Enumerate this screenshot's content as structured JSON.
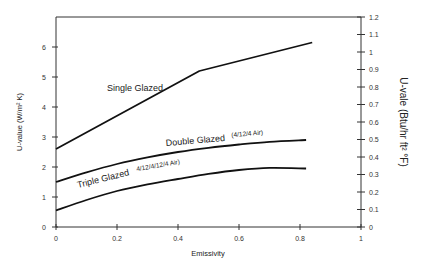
{
  "chart_data": {
    "type": "line",
    "title": "",
    "xlabel": "Emissivity",
    "ylabel": "U-value (W/m² K)",
    "ylabel_right": "U-vale (Btu/hr ft² °F)",
    "xlim": [
      0,
      1
    ],
    "ylim": [
      0,
      7
    ],
    "ylim_right": [
      0,
      1.2
    ],
    "grid": false,
    "x_ticks": [
      "0",
      "0.2",
      "0.4",
      "0.6",
      "0.8",
      "1"
    ],
    "y_ticks": [
      "0",
      "1",
      "2",
      "3",
      "4",
      "5",
      "6"
    ],
    "y_ticks_right": [
      "0",
      "0.1",
      "0.2",
      "0.3",
      "0.4",
      "0.5",
      "0.6",
      "0.7",
      "0.8",
      "0.9",
      "1",
      "1.1",
      "1.2"
    ],
    "series": [
      {
        "name": "Single Glazed",
        "annotation": "",
        "x": [
          0,
          0.47,
          0.84
        ],
        "values": [
          2.6,
          5.2,
          6.15
        ]
      },
      {
        "name": "Double Glazed",
        "annotation": "(4/12/4 Air)",
        "x": [
          0,
          0.1,
          0.2,
          0.3,
          0.4,
          0.5,
          0.6,
          0.7,
          0.82
        ],
        "values": [
          1.5,
          1.82,
          2.1,
          2.32,
          2.5,
          2.64,
          2.75,
          2.84,
          2.9
        ]
      },
      {
        "name": "Triple Glazed",
        "annotation": "4/12/4/12/4 Air)",
        "x": [
          0,
          0.1,
          0.2,
          0.3,
          0.4,
          0.5,
          0.6,
          0.7,
          0.82
        ],
        "values": [
          0.55,
          0.9,
          1.2,
          1.42,
          1.6,
          1.77,
          1.9,
          1.97,
          1.95
        ]
      }
    ]
  }
}
